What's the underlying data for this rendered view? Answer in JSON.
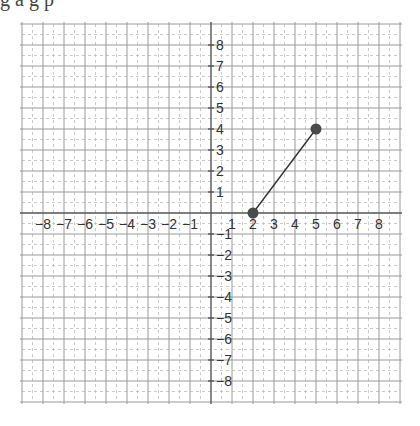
{
  "top_text": "g   a   g   p",
  "chart_data": {
    "type": "line",
    "title": "",
    "xlabel": "",
    "ylabel": "",
    "xlim": [
      -9,
      9
    ],
    "ylim": [
      -9,
      9
    ],
    "grid": true,
    "x_tick_labels": [
      -8,
      -7,
      -6,
      -5,
      -4,
      -3,
      -2,
      -1,
      1,
      2,
      3,
      4,
      5,
      6,
      7,
      8
    ],
    "y_tick_labels": [
      8,
      7,
      6,
      5,
      4,
      3,
      2,
      1,
      -1,
      -2,
      -3,
      -4,
      -5,
      -6,
      -7,
      -8
    ],
    "segments": [
      {
        "from": [
          2,
          0
        ],
        "to": [
          5,
          4
        ]
      }
    ],
    "points": [
      {
        "x": 2,
        "y": 0
      },
      {
        "x": 5,
        "y": 4
      }
    ]
  },
  "style": {
    "major_grid_color": "#9a9a9a",
    "minor_grid_color": "#bdbdbd",
    "axis_color": "#555555",
    "point_color": "#4a4a4a",
    "line_color": "#333333"
  }
}
